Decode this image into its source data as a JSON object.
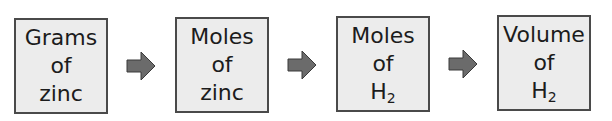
{
  "diagram": {
    "type": "flow",
    "steps": [
      {
        "line1": "Grams",
        "line2": "of",
        "line3": "zinc",
        "line3_sub": ""
      },
      {
        "line1": "Moles",
        "line2": "of",
        "line3": "zinc",
        "line3_sub": ""
      },
      {
        "line1": "Moles",
        "line2": "of",
        "line3": "H",
        "line3_sub": "2"
      },
      {
        "line1": "Volume",
        "line2": "of",
        "line3": "H",
        "line3_sub": "2"
      }
    ],
    "arrows": [
      {
        "from": 0,
        "to": 1,
        "icon": "right-arrow-icon"
      },
      {
        "from": 1,
        "to": 2,
        "icon": "right-arrow-icon"
      },
      {
        "from": 2,
        "to": 3,
        "icon": "right-arrow-icon"
      }
    ],
    "colors": {
      "box_fill": "#ececec",
      "box_border": "#4a4a4a",
      "arrow_fill": "#6b6b6b",
      "text": "#1c1c1c"
    }
  }
}
